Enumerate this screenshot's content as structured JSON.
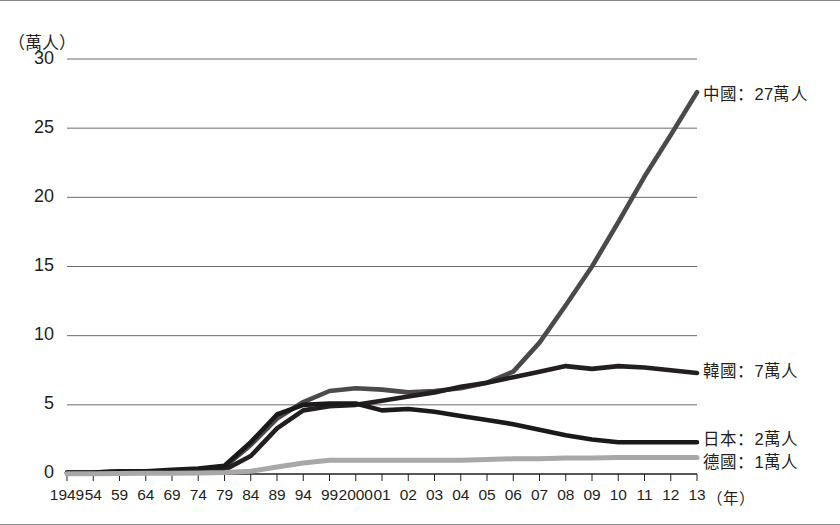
{
  "chart_data": {
    "type": "line",
    "title": "",
    "subtitle": "",
    "ylabel": "（萬人）",
    "xlabel": "（年）",
    "ylim": [
      0,
      30
    ],
    "yticks": [
      0,
      5,
      10,
      15,
      20,
      25,
      30
    ],
    "ytick_labels": [
      "0",
      "5",
      "10",
      "15",
      "20",
      "25",
      "30"
    ],
    "grid": "horizontal",
    "legend_position": "right-of-line-ends",
    "categories": [
      "1949",
      "54",
      "59",
      "64",
      "69",
      "74",
      "79",
      "84",
      "89",
      "94",
      "99",
      "2000",
      "01",
      "02",
      "03",
      "04",
      "05",
      "06",
      "07",
      "08",
      "09",
      "10",
      "11",
      "12",
      "13"
    ],
    "series": [
      {
        "name": "中國",
        "label": "中國：27萬人",
        "end_value_text": "27萬人",
        "color": "#4a4a4a",
        "values": [
          0.1,
          0.1,
          0.2,
          0.2,
          0.2,
          0.3,
          0.5,
          2.1,
          4.0,
          5.2,
          6.0,
          6.2,
          6.1,
          5.9,
          6.0,
          6.2,
          6.6,
          7.4,
          9.5,
          12.2,
          15.0,
          18.2,
          21.5,
          24.5,
          27.6
        ]
      },
      {
        "name": "韓國",
        "label": "韓國：7萬人",
        "end_value_text": "7萬人",
        "color": "#231f20",
        "values": [
          0.05,
          0.05,
          0.1,
          0.1,
          0.1,
          0.2,
          0.3,
          1.3,
          3.3,
          4.6,
          4.9,
          5.0,
          5.3,
          5.6,
          5.9,
          6.3,
          6.6,
          7.0,
          7.4,
          7.8,
          7.6,
          7.8,
          7.7,
          7.5,
          7.3
        ]
      },
      {
        "name": "日本",
        "label": "日本：2萬人",
        "end_value_text": "2萬人",
        "color": "#1a1a1a",
        "values": [
          0.1,
          0.1,
          0.2,
          0.2,
          0.3,
          0.4,
          0.6,
          2.3,
          4.3,
          5.0,
          5.1,
          5.1,
          4.6,
          4.7,
          4.5,
          4.2,
          3.9,
          3.6,
          3.2,
          2.8,
          2.5,
          2.3,
          2.3,
          2.3,
          2.3
        ]
      },
      {
        "name": "德國",
        "label": "德國：1萬人",
        "end_value_text": "1萬人",
        "color": "#a8a8a8",
        "values": [
          0.02,
          0.02,
          0.03,
          0.05,
          0.05,
          0.08,
          0.1,
          0.2,
          0.5,
          0.8,
          1.0,
          1.0,
          1.0,
          1.0,
          1.0,
          1.0,
          1.05,
          1.1,
          1.1,
          1.15,
          1.15,
          1.2,
          1.2,
          1.2,
          1.2
        ]
      }
    ]
  },
  "colors": {
    "axis": "#231f20",
    "gridline": "#5a5a5a",
    "frame": "#8a8a8a"
  }
}
